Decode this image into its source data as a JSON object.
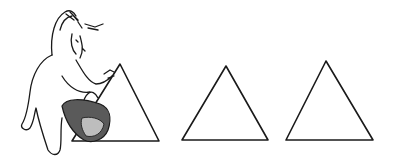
{
  "illustration": {
    "description": "Hand-drawn line illustration of a cartoon figure carrying a bag, reaching toward the first of three triangles",
    "figure": {
      "label": "cartoon-figure",
      "holding": "bag"
    },
    "shapes": [
      {
        "type": "triangle",
        "apex": [
          120,
          64
        ],
        "base_left": [
          72,
          141
        ],
        "base_right": [
          159,
          141
        ]
      },
      {
        "type": "triangle",
        "apex": [
          226,
          66
        ],
        "base_left": [
          182,
          140
        ],
        "base_right": [
          268,
          140
        ]
      },
      {
        "type": "triangle",
        "apex": [
          326,
          61
        ],
        "base_left": [
          286,
          140
        ],
        "base_right": [
          373,
          140
        ]
      }
    ],
    "colors": {
      "line": "#1a1a1a",
      "background": "#ffffff",
      "bag": "#5a5a5a",
      "bag_light": "#bdbdbd"
    }
  }
}
